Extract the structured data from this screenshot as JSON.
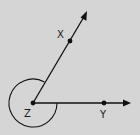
{
  "diagram": {
    "type": "geometry-angle",
    "background": "#d5d5d5",
    "stroke_color": "#111111",
    "vertex": {
      "label": "Z",
      "x": 33,
      "y": 103
    },
    "points": [
      {
        "label": "X",
        "x": 70,
        "y": 41
      },
      {
        "label": "Y",
        "x": 104,
        "y": 103
      }
    ],
    "rays": [
      {
        "from": "Z",
        "through": "X",
        "end": [
          87,
          11
        ]
      },
      {
        "from": "Z",
        "through": "Y",
        "end": [
          131,
          103
        ]
      }
    ],
    "angle_arc": {
      "center": "Z",
      "radius": 24,
      "kind": "reflex",
      "from": "ZX",
      "to": "ZY"
    }
  }
}
